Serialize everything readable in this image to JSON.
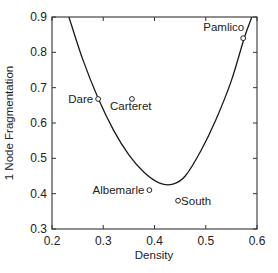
{
  "chart_data": {
    "type": "scatter",
    "title": "",
    "xlabel": "Density",
    "ylabel": "1 Node Fragmentation",
    "xlim": [
      0.2,
      0.6
    ],
    "ylim": [
      0.3,
      0.9
    ],
    "xticks": [
      "0.2",
      "0.3",
      "0.4",
      "0.5",
      "0.6"
    ],
    "yticks": [
      "0.3",
      "0.4",
      "0.5",
      "0.6",
      "0.7",
      "0.8",
      "0.9"
    ],
    "grid": false,
    "legend": null,
    "points": [
      {
        "label": "Dare",
        "x": 0.29,
        "y": 0.668,
        "label_pos": "left"
      },
      {
        "label": "Carteret",
        "x": 0.356,
        "y": 0.668,
        "label_pos": "below"
      },
      {
        "label": "Albemarle",
        "x": 0.39,
        "y": 0.41,
        "label_pos": "left"
      },
      {
        "label": "South",
        "x": 0.446,
        "y": 0.38,
        "label_pos": "right"
      },
      {
        "label": "Pamlico",
        "x": 0.573,
        "y": 0.84,
        "label_pos": "above-left"
      }
    ],
    "fit_curve": {
      "type": "line",
      "description": "U-shaped fitted curve",
      "x": [
        0.233,
        0.26,
        0.29,
        0.32,
        0.35,
        0.38,
        0.41,
        0.436,
        0.46,
        0.49,
        0.52,
        0.55,
        0.575,
        0.59
      ],
      "y": [
        0.9,
        0.78,
        0.67,
        0.58,
        0.51,
        0.46,
        0.43,
        0.427,
        0.45,
        0.52,
        0.61,
        0.72,
        0.84,
        0.9
      ]
    }
  }
}
